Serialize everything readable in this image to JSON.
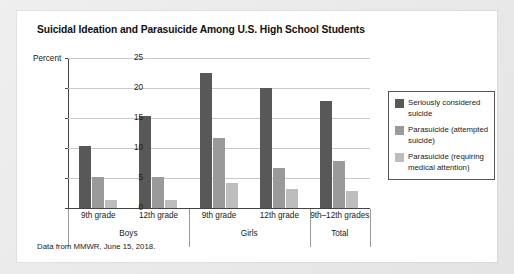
{
  "card": {
    "title": "Suicidal Ideation and Parasuicide Among U.S. High School Students",
    "source_note": "Data from MMWR, June 15, 2018."
  },
  "chart_data": {
    "type": "bar",
    "title": "Suicidal Ideation and Parasuicide Among U.S. High School Students",
    "xlabel": "",
    "ylabel": "Percent",
    "ylim": [
      0,
      25
    ],
    "yticks": [
      0,
      5,
      10,
      15,
      20,
      25
    ],
    "grid": true,
    "legend_position": "right",
    "categories": [
      "9th grade",
      "12th grade",
      "9th grade",
      "12th grade",
      "9th–12th grades"
    ],
    "groups": [
      {
        "label": "Boys",
        "categories": [
          "9th grade",
          "12th grade"
        ]
      },
      {
        "label": "Girls",
        "categories": [
          "9th grade",
          "12th grade"
        ]
      },
      {
        "label": "Total",
        "categories": [
          "9th–12th grades"
        ]
      }
    ],
    "series": [
      {
        "name": "Seriously considered suicide",
        "color": "#585858",
        "values": [
          10.3,
          15.4,
          22.5,
          20.0,
          17.9
        ]
      },
      {
        "name": "Parasuicide (attempted suicide)",
        "color": "#9a9a9a",
        "values": [
          5.1,
          5.1,
          11.6,
          6.7,
          7.8
        ]
      },
      {
        "name": "Parasuicide (requiring medical attention)",
        "color": "#bdbdbd",
        "values": [
          1.3,
          1.3,
          4.1,
          3.1,
          2.8
        ]
      }
    ],
    "legend": [
      "Seriously considered suicide",
      "Parasuicide (attempted suicide)",
      "Parasuicide (requiring medical attention)"
    ],
    "source": "Data from MMWR, June 15, 2018."
  }
}
